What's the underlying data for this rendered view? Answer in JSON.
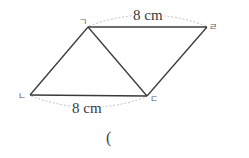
{
  "diagram": {
    "type": "parallelogram-with-diagonal",
    "vertices": {
      "top_left": {
        "label": "ㄱ",
        "x": 88,
        "y": 27
      },
      "top_right": {
        "label": "ㄹ",
        "x": 207,
        "y": 27
      },
      "bottom_left": {
        "label": "ㄴ",
        "x": 30,
        "y": 95
      },
      "bottom_right": {
        "label": "ㄷ",
        "x": 147,
        "y": 96
      }
    },
    "edges": [
      [
        "ㄱ",
        "ㄹ"
      ],
      [
        "ㄹ",
        "ㄷ"
      ],
      [
        "ㄷ",
        "ㄴ"
      ],
      [
        "ㄴ",
        "ㄱ"
      ],
      [
        "ㄱ",
        "ㄷ"
      ]
    ],
    "measurements": {
      "top": {
        "edge": "ㄱㄹ",
        "label": "8 cm"
      },
      "bottom": {
        "edge": "ㄴㄷ",
        "label": "8 cm"
      }
    },
    "colors": {
      "line": "#3a3a3a",
      "dashed_arc": "#b8b8b8",
      "text": "#3a3a3a"
    }
  },
  "answer": {
    "open_paren": "("
  }
}
